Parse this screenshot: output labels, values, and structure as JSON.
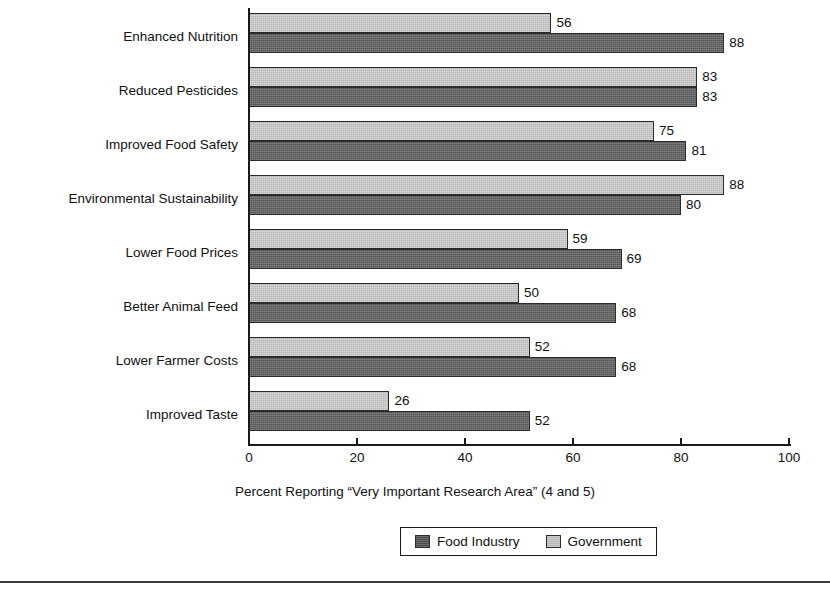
{
  "chart_data": {
    "type": "bar",
    "orientation": "horizontal",
    "title": "",
    "xlabel": "Percent Reporting “Very Important Research Area” (4 and 5)",
    "ylabel": "",
    "xlim": [
      0,
      100
    ],
    "xticks": [
      0,
      20,
      40,
      60,
      80,
      100
    ],
    "xtick_labels": [
      "0",
      "20",
      "40",
      "60",
      "80",
      "100"
    ],
    "grid": false,
    "legend_position": "bottom-center",
    "categories": [
      "Enhanced Nutrition",
      "Reduced Pesticides",
      "Improved Food Safety",
      "Environmental Sustainability",
      "Lower Food Prices",
      "Better Animal Feed",
      "Lower Farmer Costs",
      "Improved Taste"
    ],
    "series": [
      {
        "name": "Government",
        "color": "#b6b6b6",
        "values": [
          56,
          83,
          75,
          88,
          59,
          50,
          52,
          26
        ]
      },
      {
        "name": "Food Industry",
        "color": "#555555",
        "values": [
          88,
          83,
          81,
          80,
          69,
          68,
          68,
          52
        ]
      }
    ],
    "value_labels": {
      "Enhanced Nutrition": {
        "government": "56",
        "food_industry": "88"
      },
      "Reduced Pesticides": {
        "government": "83",
        "food_industry": "83"
      },
      "Improved Food Safety": {
        "government": "75",
        "food_industry": "81"
      },
      "Environmental Sustainability": {
        "government": "88",
        "food_industry": "80"
      },
      "Lower Food Prices": {
        "government": "59",
        "food_industry": "69"
      },
      "Better Animal Feed": {
        "government": "50",
        "food_industry": "68"
      },
      "Lower Farmer Costs": {
        "government": "52",
        "food_industry": "68"
      },
      "Improved Taste": {
        "government": "26",
        "food_industry": "52"
      }
    }
  },
  "legend": {
    "entries": [
      {
        "label": "Food Industry",
        "color": "#4d4d4d"
      },
      {
        "label": "Government",
        "color": "#b6b6b6"
      }
    ]
  }
}
